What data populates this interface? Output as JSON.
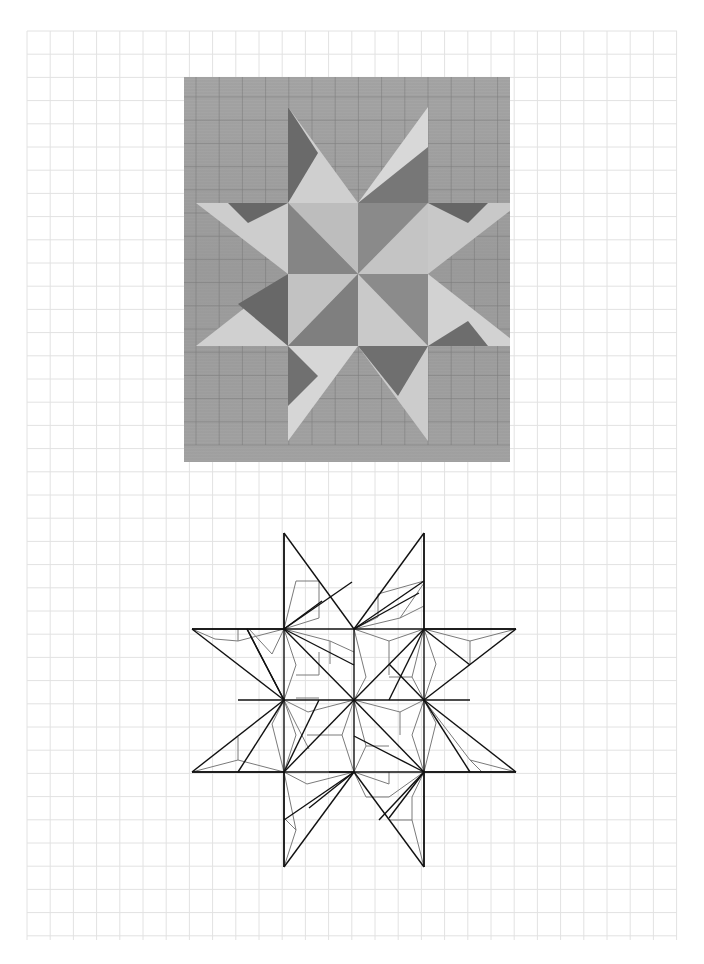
{
  "page": {
    "background": "#ffffff",
    "grid": {
      "x0": 27,
      "y0": 31,
      "x1": 677,
      "y1": 940,
      "spacing": 23.2,
      "color": "#e2e2e2"
    }
  },
  "photo": {
    "description": "Photograph of a chip-carved eight-pointed star in light wood with pencil grid lines",
    "x": 184,
    "y": 77,
    "width": 326,
    "height": 385,
    "wood_color": "#9a9a9a"
  },
  "drawing": {
    "description": "Line drawing of the chip-carved eight-pointed star pattern",
    "stroke_primary": "#111111",
    "stroke_secondary": "#7a7a7a",
    "nodes_x": [
      284,
      354,
      424
    ],
    "nodes_y": [
      629,
      700,
      772
    ],
    "tips": [
      [
        284,
        533
      ],
      [
        424,
        533
      ],
      [
        516,
        629
      ],
      [
        516,
        772
      ],
      [
        424,
        867
      ],
      [
        284,
        867
      ],
      [
        192,
        772
      ],
      [
        192,
        629
      ]
    ]
  }
}
